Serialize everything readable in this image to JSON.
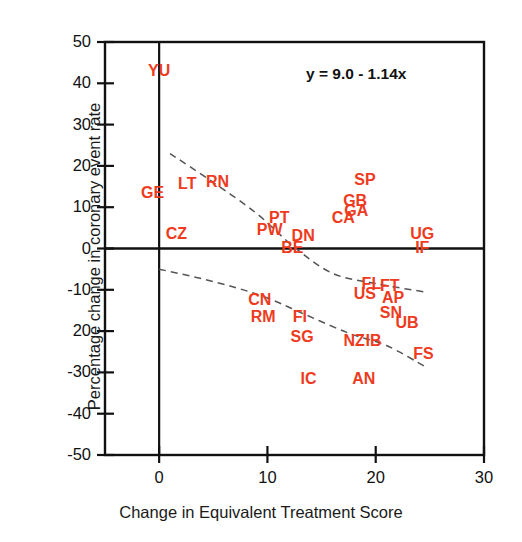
{
  "chart_data": {
    "type": "scatter",
    "title": "",
    "xlabel": "Change in Equivalent Treatment Score",
    "ylabel": "Percentage change in coronary event rate",
    "xlim": [
      -5,
      30
    ],
    "ylim": [
      -50,
      50
    ],
    "xticks": [
      "0",
      "10",
      "20",
      "30"
    ],
    "xtick_values": [
      0,
      10,
      20,
      30
    ],
    "yticks": [
      "50",
      "40",
      "30",
      "20",
      "10",
      "0",
      "-10",
      "20",
      "-30",
      "-40",
      "-50"
    ],
    "ytick_values": [
      50,
      40,
      30,
      20,
      10,
      0,
      -10,
      -20,
      -30,
      -40,
      -50
    ],
    "grid": false,
    "legend": null,
    "annotations": [
      {
        "text": "y = 9.0 - 1.14x",
        "x": 18.2,
        "y": 42.0
      }
    ],
    "point_color": "#ee3b1e",
    "axis_color": "#111111",
    "labels_are_points": true,
    "points": [
      {
        "label": "YU",
        "x": 0.0,
        "y": 43.0
      },
      {
        "label": "GE",
        "x": -0.6,
        "y": 13.5
      },
      {
        "label": "LT",
        "x": 2.6,
        "y": 15.5
      },
      {
        "label": "RN",
        "x": 5.4,
        "y": 16.0
      },
      {
        "label": "CZ",
        "x": 1.6,
        "y": 3.5
      },
      {
        "label": "PT",
        "x": 11.1,
        "y": 7.5
      },
      {
        "label": "PW",
        "x": 10.2,
        "y": 4.5
      },
      {
        "label": "BE",
        "x": 12.3,
        "y": 0.2
      },
      {
        "label": "DN",
        "x": 13.3,
        "y": 3.0
      },
      {
        "label": "CA",
        "x": 17.0,
        "y": 7.5
      },
      {
        "label": "GA",
        "x": 18.2,
        "y": 9.0
      },
      {
        "label": "GB",
        "x": 18.1,
        "y": 11.5
      },
      {
        "label": "SP",
        "x": 19.0,
        "y": 16.5
      },
      {
        "label": "UG",
        "x": 24.3,
        "y": 3.5
      },
      {
        "label": "IF",
        "x": 24.3,
        "y": 0.2
      },
      {
        "label": "FL",
        "x": 19.6,
        "y": -8.5
      },
      {
        "label": "FT",
        "x": 21.3,
        "y": -9.0
      },
      {
        "label": "US",
        "x": 19.0,
        "y": -11.0
      },
      {
        "label": "AP",
        "x": 21.6,
        "y": -12.0
      },
      {
        "label": "SN",
        "x": 21.4,
        "y": -15.5
      },
      {
        "label": "UB",
        "x": 22.9,
        "y": -18.0
      },
      {
        "label": "CN",
        "x": 9.3,
        "y": -12.5
      },
      {
        "label": "RM",
        "x": 9.6,
        "y": -16.5
      },
      {
        "label": "FI",
        "x": 13.0,
        "y": -16.5
      },
      {
        "label": "SG",
        "x": 13.2,
        "y": -21.5
      },
      {
        "label": "NZ",
        "x": 18.0,
        "y": -22.5
      },
      {
        "label": "IB",
        "x": 19.8,
        "y": -22.5
      },
      {
        "label": "FS",
        "x": 24.4,
        "y": -25.5
      },
      {
        "label": "IC",
        "x": 13.8,
        "y": -31.5
      },
      {
        "label": "AN",
        "x": 18.9,
        "y": -31.5
      }
    ],
    "trend_curves": [
      {
        "name": "upper-dashed-curve",
        "style": "dashed",
        "color": "#555555",
        "points": [
          [
            1.0,
            23.0
          ],
          [
            5.0,
            16.0
          ],
          [
            9.0,
            8.5
          ],
          [
            12.4,
            0.5
          ],
          [
            16.0,
            -6.0
          ],
          [
            20.0,
            -8.5
          ],
          [
            24.5,
            -10.5
          ]
        ]
      },
      {
        "name": "lower-dashed-curve",
        "style": "dashed",
        "color": "#555555",
        "points": [
          [
            0.0,
            -5.0
          ],
          [
            5.0,
            -8.0
          ],
          [
            9.5,
            -11.5
          ],
          [
            13.5,
            -16.0
          ],
          [
            17.5,
            -20.5
          ],
          [
            21.0,
            -23.5
          ],
          [
            24.5,
            -28.5
          ]
        ]
      }
    ],
    "reference_lines": [
      {
        "name": "x-zero-vertical-line",
        "orientation": "vertical",
        "value": 0
      },
      {
        "name": "y-zero-horizontal-line",
        "orientation": "horizontal",
        "value": 0
      }
    ]
  }
}
